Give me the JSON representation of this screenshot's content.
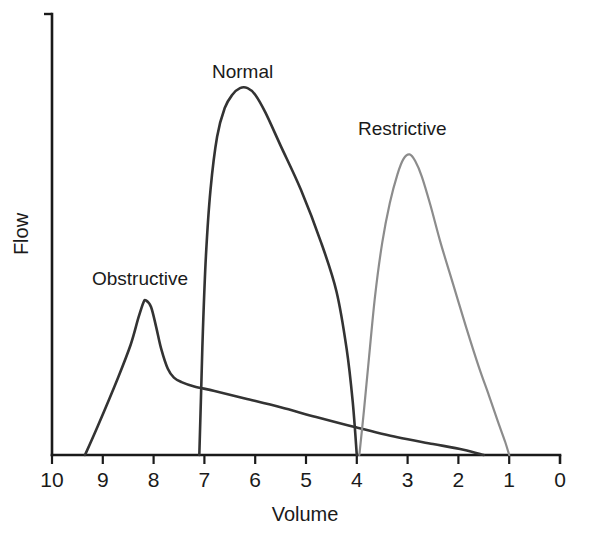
{
  "figure": {
    "title_visible": false,
    "background_color": "#ffffff"
  },
  "axes": {
    "x": {
      "label": "Volume",
      "tick_labels": [
        "10",
        "9",
        "8",
        "7",
        "6",
        "5",
        "4",
        "3",
        "2",
        "1",
        "0"
      ],
      "tick_values": [
        10,
        9,
        8,
        7,
        6,
        5,
        4,
        3,
        2,
        1,
        0
      ],
      "direction": "descending-left-to-right",
      "range": [
        10,
        0
      ]
    },
    "y": {
      "label": "Flow",
      "tick_labels": [],
      "range": [
        0,
        1
      ]
    },
    "axis_color": "#1a1a1a"
  },
  "curve_labels": [
    {
      "text": "Obstructive",
      "x_px": 92,
      "y_px": 285,
      "color": "#333333"
    },
    {
      "text": "Normal",
      "x_px": 212,
      "y_px": 78,
      "color": "#333333"
    },
    {
      "text": "Restrictive",
      "x_px": 358,
      "y_px": 135,
      "color": "#333333"
    }
  ],
  "chart_data": {
    "type": "line",
    "title": "",
    "subtitle": "",
    "xlabel": "Volume",
    "ylabel": "Flow",
    "xlim": [
      10,
      0
    ],
    "ylim": [
      0,
      1
    ],
    "grid": false,
    "legend": "inline-annotations",
    "x_tick_labels": [
      "10",
      "9",
      "8",
      "7",
      "6",
      "5",
      "4",
      "3",
      "2",
      "1",
      "0"
    ],
    "y_tick_labels": [],
    "annotations": [
      "Obstructive",
      "Normal",
      "Restrictive"
    ],
    "series": [
      {
        "name": "Obstructive",
        "color": "#333333",
        "line_width": 2.6,
        "peak_volume": 8.15,
        "peak_flow": 0.35,
        "start_volume": 9.35,
        "end_volume": 1.5,
        "points": [
          [
            9.35,
            0.0
          ],
          [
            9.1,
            0.065
          ],
          [
            8.7,
            0.175
          ],
          [
            8.45,
            0.25
          ],
          [
            8.3,
            0.31
          ],
          [
            8.2,
            0.345
          ],
          [
            8.15,
            0.35
          ],
          [
            8.05,
            0.335
          ],
          [
            7.95,
            0.29
          ],
          [
            7.85,
            0.24
          ],
          [
            7.72,
            0.195
          ],
          [
            7.6,
            0.175
          ],
          [
            7.45,
            0.165
          ],
          [
            7.2,
            0.155
          ],
          [
            6.8,
            0.145
          ],
          [
            6.2,
            0.128
          ],
          [
            5.5,
            0.108
          ],
          [
            4.8,
            0.086
          ],
          [
            4.0,
            0.062
          ],
          [
            3.2,
            0.04
          ],
          [
            2.5,
            0.025
          ],
          [
            1.9,
            0.012
          ],
          [
            1.5,
            0.0
          ]
        ]
      },
      {
        "name": "Normal",
        "color": "#333333",
        "line_width": 2.6,
        "peak_volume": 6.2,
        "peak_flow": 0.83,
        "start_volume": 7.1,
        "end_volume": 4.0,
        "points": [
          [
            7.1,
            0.0
          ],
          [
            7.07,
            0.12
          ],
          [
            7.03,
            0.28
          ],
          [
            6.97,
            0.45
          ],
          [
            6.88,
            0.6
          ],
          [
            6.75,
            0.72
          ],
          [
            6.6,
            0.785
          ],
          [
            6.45,
            0.815
          ],
          [
            6.3,
            0.83
          ],
          [
            6.15,
            0.83
          ],
          [
            6.0,
            0.815
          ],
          [
            5.8,
            0.775
          ],
          [
            5.5,
            0.7
          ],
          [
            5.1,
            0.6
          ],
          [
            4.7,
            0.48
          ],
          [
            4.4,
            0.37
          ],
          [
            4.2,
            0.24
          ],
          [
            4.08,
            0.12
          ],
          [
            4.0,
            0.0
          ]
        ]
      },
      {
        "name": "Restrictive",
        "color": "#8c8c8c",
        "line_width": 2.2,
        "peak_volume": 3.0,
        "peak_flow": 0.68,
        "start_volume": 3.95,
        "end_volume": 1.0,
        "points": [
          [
            3.95,
            0.0
          ],
          [
            3.86,
            0.1
          ],
          [
            3.76,
            0.22
          ],
          [
            3.64,
            0.36
          ],
          [
            3.5,
            0.48
          ],
          [
            3.35,
            0.57
          ],
          [
            3.2,
            0.635
          ],
          [
            3.08,
            0.67
          ],
          [
            2.96,
            0.68
          ],
          [
            2.85,
            0.665
          ],
          [
            2.72,
            0.63
          ],
          [
            2.55,
            0.565
          ],
          [
            2.35,
            0.48
          ],
          [
            2.1,
            0.385
          ],
          [
            1.85,
            0.29
          ],
          [
            1.6,
            0.2
          ],
          [
            1.4,
            0.135
          ],
          [
            1.22,
            0.075
          ],
          [
            1.08,
            0.03
          ],
          [
            1.0,
            0.0
          ]
        ]
      }
    ]
  },
  "geometry": {
    "x_axis_y_px": 455,
    "x_axis_left_px": 52,
    "x_axis_right_px": 560,
    "y_axis_x_px": 52,
    "y_axis_top_px": 14,
    "px_per_volume_unit": 50.8,
    "flow_full_scale_px": 442
  }
}
